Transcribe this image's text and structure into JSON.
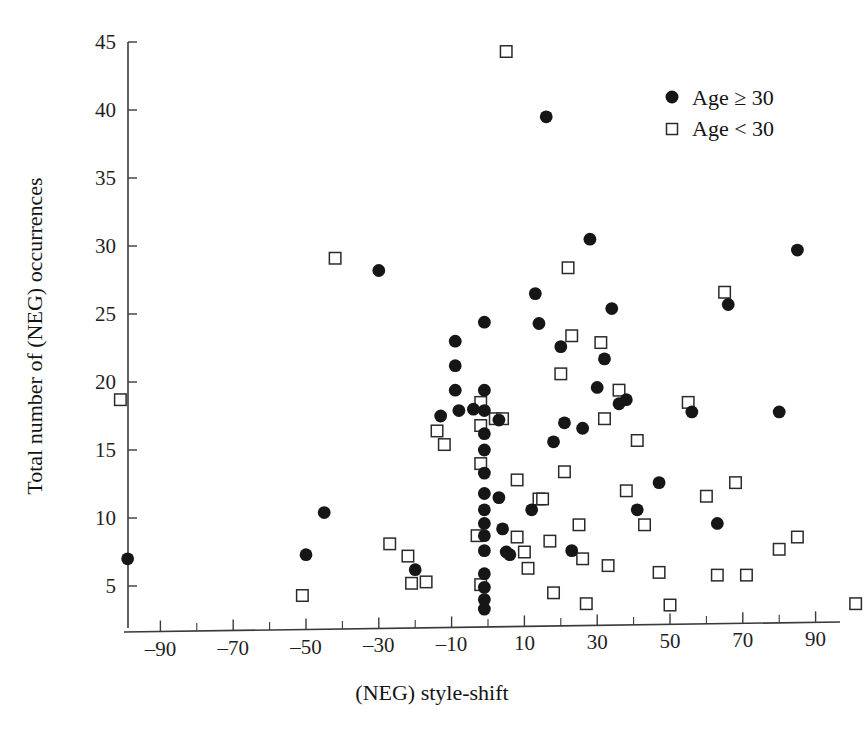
{
  "chart_data": {
    "type": "scatter",
    "title": "",
    "xlabel": "(NEG) style-shift",
    "ylabel": "Total number of (NEG) occurrences",
    "xlim": [
      -105,
      105
    ],
    "ylim": [
      2,
      45
    ],
    "grid": false,
    "x_major_ticks": [
      -90,
      -70,
      -50,
      -30,
      -10,
      10,
      30,
      50,
      70,
      90
    ],
    "x_major_tick_labels": [
      "–90",
      "–70",
      "–50",
      "–30",
      "–10",
      "10",
      "30",
      "50",
      "70",
      "90"
    ],
    "x_minor_ticks": [
      -100,
      -80,
      -60,
      -40,
      -20,
      0,
      20,
      40,
      60,
      80,
      100
    ],
    "y_major_ticks": [
      5,
      10,
      15,
      20,
      25,
      30,
      35,
      40,
      45
    ],
    "y_major_tick_labels": [
      "5",
      "10",
      "15",
      "20",
      "25",
      "30",
      "35",
      "40",
      "45"
    ],
    "legend": {
      "position": "top-right",
      "entries": [
        {
          "label": "Age ≥ 30",
          "marker": "filled-circle",
          "color": "#161616"
        },
        {
          "label": "Age < 30",
          "marker": "open-square",
          "color": "#2b2b2b"
        }
      ]
    },
    "series": [
      {
        "name": "Age ≥ 30",
        "marker": "filled-circle",
        "color": "#161616",
        "points": [
          [
            -99,
            7.0
          ],
          [
            -50,
            7.3
          ],
          [
            -45,
            10.4
          ],
          [
            -30,
            28.2
          ],
          [
            -20,
            6.2
          ],
          [
            -13,
            17.5
          ],
          [
            -9,
            23.0
          ],
          [
            -9,
            21.2
          ],
          [
            -9,
            19.4
          ],
          [
            -8,
            17.9
          ],
          [
            -4,
            18.0
          ],
          [
            -1,
            24.4
          ],
          [
            -1,
            19.4
          ],
          [
            -1,
            17.9
          ],
          [
            -1,
            16.2
          ],
          [
            -1,
            15.0
          ],
          [
            -1,
            13.3
          ],
          [
            -1,
            11.8
          ],
          [
            -1,
            10.6
          ],
          [
            -1,
            9.6
          ],
          [
            -1,
            8.7
          ],
          [
            -1,
            7.6
          ],
          [
            -1,
            5.9
          ],
          [
            -1,
            4.9
          ],
          [
            -1,
            4.0
          ],
          [
            -1,
            3.3
          ],
          [
            3,
            17.2
          ],
          [
            3,
            11.5
          ],
          [
            4,
            9.2
          ],
          [
            5,
            7.5
          ],
          [
            6,
            7.3
          ],
          [
            12,
            10.6
          ],
          [
            13,
            26.5
          ],
          [
            14,
            24.3
          ],
          [
            16,
            39.5
          ],
          [
            18,
            15.6
          ],
          [
            20,
            22.6
          ],
          [
            21,
            17.0
          ],
          [
            23,
            7.6
          ],
          [
            26,
            16.6
          ],
          [
            28,
            30.5
          ],
          [
            30,
            19.6
          ],
          [
            32,
            21.7
          ],
          [
            34,
            25.4
          ],
          [
            36,
            18.4
          ],
          [
            38,
            18.7
          ],
          [
            41,
            10.6
          ],
          [
            47,
            12.6
          ],
          [
            56,
            17.8
          ],
          [
            63,
            9.6
          ],
          [
            66,
            25.7
          ],
          [
            80,
            17.8
          ],
          [
            85,
            29.7
          ]
        ]
      },
      {
        "name": "Age < 30",
        "marker": "open-square",
        "color": "#2b2b2b",
        "points": [
          [
            -101,
            18.7
          ],
          [
            -51,
            4.3
          ],
          [
            -42,
            29.1
          ],
          [
            -27,
            8.1
          ],
          [
            -22,
            7.2
          ],
          [
            -21,
            5.2
          ],
          [
            -17,
            5.3
          ],
          [
            -14,
            16.4
          ],
          [
            -12,
            15.4
          ],
          [
            -2,
            18.5
          ],
          [
            -2,
            16.8
          ],
          [
            -2,
            14.0
          ],
          [
            -2,
            5.1
          ],
          [
            -3,
            8.7
          ],
          [
            2,
            17.3
          ],
          [
            4,
            17.3
          ],
          [
            5,
            44.3
          ],
          [
            8,
            12.8
          ],
          [
            8,
            8.6
          ],
          [
            10,
            7.5
          ],
          [
            11,
            6.3
          ],
          [
            14,
            11.4
          ],
          [
            15,
            11.4
          ],
          [
            17,
            8.3
          ],
          [
            18,
            4.5
          ],
          [
            20,
            20.6
          ],
          [
            21,
            13.4
          ],
          [
            22,
            28.4
          ],
          [
            23,
            23.4
          ],
          [
            25,
            9.5
          ],
          [
            26,
            7.0
          ],
          [
            27,
            3.7
          ],
          [
            31,
            22.9
          ],
          [
            32,
            17.3
          ],
          [
            33,
            6.5
          ],
          [
            36,
            19.4
          ],
          [
            38,
            12.0
          ],
          [
            41,
            15.7
          ],
          [
            43,
            9.5
          ],
          [
            47,
            6.0
          ],
          [
            50,
            3.6
          ],
          [
            55,
            18.5
          ],
          [
            60,
            11.6
          ],
          [
            63,
            5.8
          ],
          [
            65,
            26.6
          ],
          [
            68,
            12.6
          ],
          [
            71,
            5.8
          ],
          [
            80,
            7.7
          ],
          [
            85,
            8.6
          ],
          [
            101,
            3.7
          ]
        ]
      }
    ]
  },
  "caption": ""
}
